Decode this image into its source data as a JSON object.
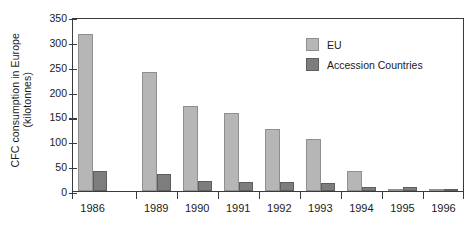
{
  "chart_data": {
    "type": "bar",
    "title": "",
    "xlabel": "",
    "ylabel": "CFC consumption in Europe (kilotonnes)",
    "ylabel_lines": [
      "CFC consumption in Europe",
      "(kilotonnes)"
    ],
    "categories": [
      "1986",
      "1989",
      "1990",
      "1991",
      "1992",
      "1993",
      "1994",
      "1995",
      "1996"
    ],
    "series": [
      {
        "name": "EU",
        "color": "#b6b6b6",
        "values": [
          315,
          240,
          172,
          157,
          125,
          104,
          41,
          1,
          3
        ]
      },
      {
        "name": "Accession Countries",
        "color": "#7d7d7d",
        "values": [
          41,
          34,
          20,
          19,
          18,
          16,
          8,
          8,
          2
        ]
      }
    ],
    "ylim": [
      0,
      350
    ],
    "yticks": [
      0,
      50,
      100,
      150,
      200,
      250,
      300,
      350
    ],
    "ytick_labels": [
      "0",
      "50",
      "100",
      "150",
      "200",
      "250",
      "300",
      "350"
    ],
    "grid": false,
    "legend_position": "top-right",
    "category_gap_after": "1986"
  },
  "legend": {
    "entries": [
      {
        "label": "EU",
        "color": "#b6b6b6"
      },
      {
        "label": "Accession Countries",
        "color": "#7d7d7d"
      }
    ]
  },
  "colors": {
    "eu": "#b6b6b6",
    "accession": "#7d7d7d",
    "axis": "#3a3a3a",
    "text": "#1a1a1a",
    "background": "#ffffff"
  }
}
